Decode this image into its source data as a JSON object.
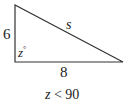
{
  "diagram": {
    "type": "right-triangle",
    "labels": {
      "vertical_side": "6",
      "hypotenuse": "s",
      "angle_var": "z",
      "angle_unit": "°",
      "horizontal_side": "8"
    },
    "condition": {
      "var": "z",
      "op": " < ",
      "value": "90"
    },
    "colors": {
      "stroke": "#333333",
      "background": "#ffffff"
    }
  }
}
